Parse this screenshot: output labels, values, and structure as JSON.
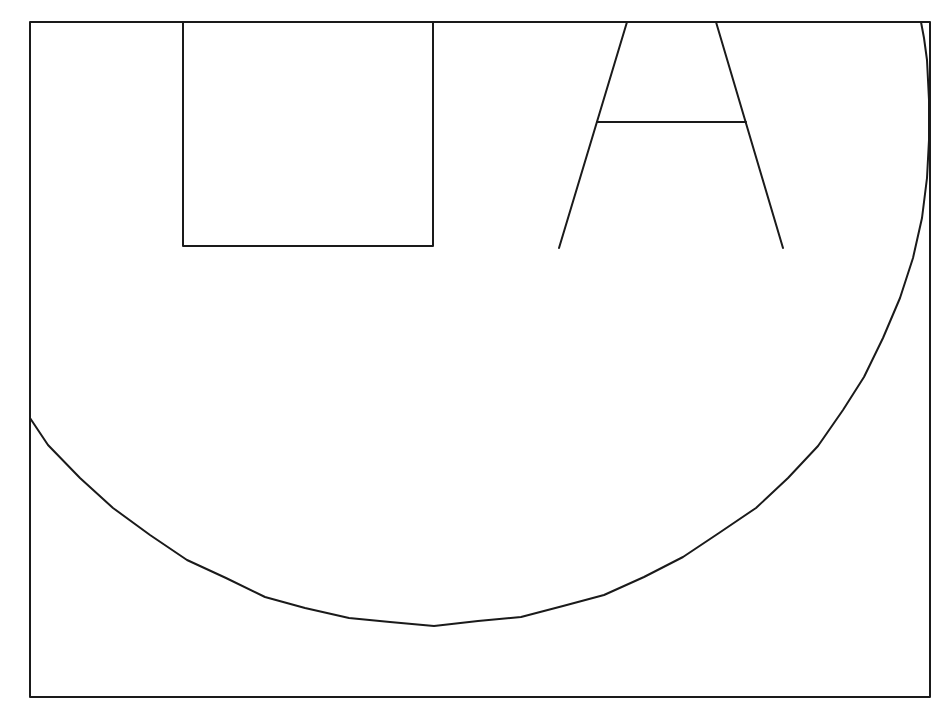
{
  "canvas": {
    "width": 951,
    "height": 713,
    "background": "#ffffff",
    "stroke_color": "#1a1a1a",
    "stroke_width": 2
  },
  "frame": {
    "x1": 30,
    "y1": 22,
    "x2": 930,
    "y2": 697
  },
  "square": {
    "x1": 183,
    "y1": 22,
    "x2": 433,
    "y2": 246
  },
  "letter_a": {
    "left_leg": [
      [
        627,
        22
      ],
      [
        559,
        248
      ]
    ],
    "right_leg": [
      [
        716,
        22
      ],
      [
        783,
        248
      ]
    ],
    "crossbar": [
      [
        597,
        122
      ],
      [
        746,
        122
      ]
    ]
  },
  "arc": {
    "points": [
      [
        30,
        418
      ],
      [
        48,
        445
      ],
      [
        80,
        478
      ],
      [
        113,
        508
      ],
      [
        150,
        535
      ],
      [
        187,
        560
      ],
      [
        226,
        578
      ],
      [
        265,
        597
      ],
      [
        305,
        608
      ],
      [
        349,
        618
      ],
      [
        390,
        622
      ],
      [
        434,
        626
      ],
      [
        478,
        621
      ],
      [
        521,
        617
      ],
      [
        563,
        606
      ],
      [
        604,
        595
      ],
      [
        644,
        577
      ],
      [
        683,
        557
      ],
      [
        719,
        533
      ],
      [
        756,
        508
      ],
      [
        788,
        478
      ],
      [
        818,
        446
      ],
      [
        843,
        410
      ],
      [
        864,
        377
      ],
      [
        883,
        338
      ],
      [
        900,
        298
      ],
      [
        913,
        258
      ],
      [
        922,
        218
      ],
      [
        927,
        178
      ],
      [
        929,
        140
      ],
      [
        929,
        100
      ],
      [
        927,
        60
      ],
      [
        924,
        38
      ],
      [
        921,
        22
      ]
    ]
  }
}
